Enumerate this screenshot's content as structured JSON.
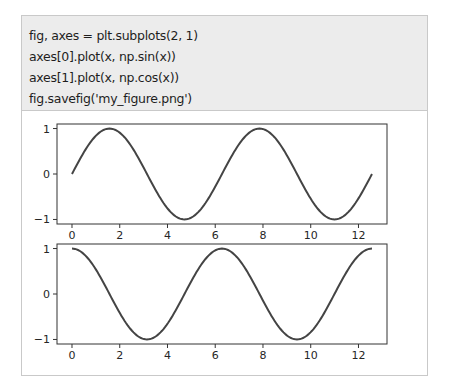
{
  "code_cell": {
    "lines": [
      "fig, axes = plt.subplots(2, 1)",
      "axes[0].plot(x, np.sin(x))",
      "axes[1].plot(x, np.cos(x))",
      "fig.savefig('my_figure.png')"
    ]
  },
  "colors": {
    "code_background": "#ececec",
    "border": "#c9c9c9",
    "line": "#444444",
    "axes": "#333333"
  },
  "chart_data": [
    {
      "type": "line",
      "title": "",
      "xlabel": "",
      "ylabel": "",
      "function": "sin",
      "x_domain": [
        0,
        12.566
      ],
      "xlim": [
        -0.628,
        13.195
      ],
      "ylim": [
        -1.1,
        1.1
      ],
      "xticks": [
        0,
        2,
        4,
        6,
        8,
        10,
        12
      ],
      "xtick_labels": [
        "0",
        "2",
        "4",
        "6",
        "8",
        "10",
        "12"
      ],
      "yticks": [
        1,
        0,
        -1
      ],
      "ytick_labels": [
        "1",
        "0",
        "−1"
      ],
      "grid": false,
      "series": [
        {
          "name": "np.sin(x)",
          "samples": 200
        }
      ]
    },
    {
      "type": "line",
      "title": "",
      "xlabel": "",
      "ylabel": "",
      "function": "cos",
      "x_domain": [
        0,
        12.566
      ],
      "xlim": [
        -0.628,
        13.195
      ],
      "ylim": [
        -1.1,
        1.1
      ],
      "xticks": [
        0,
        2,
        4,
        6,
        8,
        10,
        12
      ],
      "xtick_labels": [
        "0",
        "2",
        "4",
        "6",
        "8",
        "10",
        "12"
      ],
      "yticks": [
        1,
        0,
        -1
      ],
      "ytick_labels": [
        "1",
        "0",
        "−1"
      ],
      "grid": false,
      "series": [
        {
          "name": "np.cos(x)",
          "samples": 200
        }
      ]
    }
  ]
}
